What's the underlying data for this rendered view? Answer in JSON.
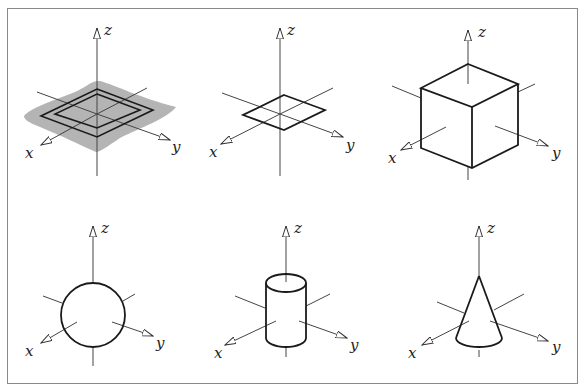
{
  "figure": {
    "axis_labels": {
      "x": "x",
      "y": "y",
      "z": "z"
    },
    "panels": [
      {
        "id": "plane",
        "shape": "plane with square outlines (gray shaded surface)"
      },
      {
        "id": "square",
        "shape": "square in xy-plane"
      },
      {
        "id": "cube",
        "shape": "cube"
      },
      {
        "id": "sphere",
        "shape": "sphere"
      },
      {
        "id": "cylinder",
        "shape": "cylinder"
      },
      {
        "id": "cone",
        "shape": "cone"
      }
    ],
    "colors": {
      "line": "#1a1a1a",
      "axis": "#444444",
      "surface": "#b4b4b4",
      "border": "#8a8a8a"
    }
  }
}
